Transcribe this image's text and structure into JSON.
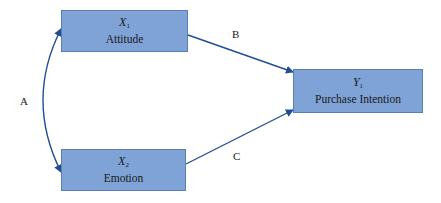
{
  "nodes": {
    "x1": {
      "symbol": "X",
      "subscript": "1",
      "name": "Attitude"
    },
    "x2": {
      "symbol": "X",
      "subscript": "2",
      "name": "Emotion"
    },
    "y1": {
      "symbol": "Y",
      "subscript": "1",
      "name": "Purchase Intention"
    }
  },
  "paths": {
    "a": {
      "label": "A",
      "from": "X1",
      "to": "X2",
      "type": "bidirectional-curve"
    },
    "b": {
      "label": "B",
      "from": "X1",
      "to": "Y1",
      "type": "arrow"
    },
    "c": {
      "label": "C",
      "from": "X2",
      "to": "Y1",
      "type": "arrow"
    }
  },
  "colors": {
    "node_fill": "#7fa3d6",
    "node_border": "#5b7fb5",
    "arrow": "#1f4e96"
  }
}
